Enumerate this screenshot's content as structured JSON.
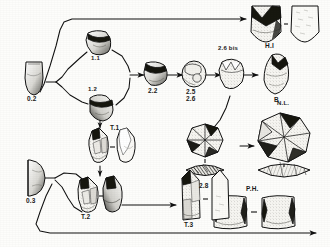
{
  "figure": {
    "background_color": "#fdfdfb",
    "ink_color": "#1a1a1a"
  },
  "stages": {
    "raw_nodule_upper": {
      "label": "0.2",
      "icon": "flint-nodule-icon",
      "description": "Unworked flint nodule, upper branch starting point"
    },
    "blank_upper": {
      "label": "1.1",
      "icon": "flake-blank-icon",
      "description": "Initial flake blank, upper variant"
    },
    "blank_lower": {
      "label": "1.2",
      "icon": "flake-blank-icon",
      "description": "Initial flake blank, lower variant"
    },
    "core_stage_2_2": {
      "label": "2.2",
      "icon": "prepared-core-icon",
      "description": "Prepared core, stage 2.2"
    },
    "core_stage_2_5_2_6": {
      "label_line1": "2.5",
      "label_line2": "2.6",
      "icon": "prepared-core-icon",
      "description": "Prepared core, stages 2.5 and 2.6"
    },
    "core_stage_2_6_bis": {
      "label": "2.6 bis",
      "icon": "prepared-core-icon",
      "description": "Prepared core variant, stage 2.6 bis"
    },
    "product_b": {
      "label": "B",
      "icon": "biface-point-icon",
      "description": "Biface / pointed product B"
    },
    "product_h1": {
      "label": "H.I",
      "icon": "scraper-pair-icon",
      "description": "Product H.I shown as worked piece plus outline"
    },
    "product_nl": {
      "label": "N.L.",
      "icon": "discoidal-core-icon",
      "description": "Product N.L., discoidal core with section view"
    },
    "core_stage_2_8": {
      "label": "2.8",
      "icon": "discoidal-core-icon",
      "description": "Discoidal core stage 2.8 with section view"
    },
    "product_ph": {
      "label": "P.H.",
      "icon": "blade-pair-icon",
      "description": "Product P.H., pair of blade segments"
    },
    "raw_nodule_lower": {
      "label": "0.3",
      "icon": "flint-nodule-half-icon",
      "description": "Unworked flint nodule, lower branch starting point"
    },
    "point_t1": {
      "label": "T.1",
      "icon": "point-pair-icon",
      "description": "Pointed tool T.1 with outline counterpart"
    },
    "point_t2": {
      "label": "T.2",
      "icon": "point-pair-icon",
      "description": "Pointed tool T.2 with outline counterpart"
    },
    "point_t3": {
      "label": "T.3",
      "icon": "point-pair-icon",
      "description": "Pointed tool T.3 with outline counterpart"
    }
  },
  "connectors": [
    {
      "name": "nodule-02-to-blank-11",
      "type": "branch-arrow"
    },
    {
      "name": "nodule-02-to-blank-12",
      "type": "branch-arrow"
    },
    {
      "name": "nodule-02-to-h1-bypass",
      "type": "long-arrow"
    },
    {
      "name": "blank-11-to-core-22",
      "type": "merge-arrow"
    },
    {
      "name": "blank-12-to-core-22",
      "type": "merge-arrow"
    },
    {
      "name": "blank-12-down-to-t1",
      "type": "down-arrow"
    },
    {
      "name": "core-22-to-core-25",
      "type": "straight-arrow"
    },
    {
      "name": "core-25-to-core-26bis",
      "type": "straight-arrow"
    },
    {
      "name": "core-26bis-to-product-b",
      "type": "straight-arrow"
    },
    {
      "name": "core-26bis-to-core-28",
      "type": "curved-arrow"
    },
    {
      "name": "core-28-to-nl",
      "type": "straight-arrow"
    },
    {
      "name": "t1-to-t2",
      "type": "down-arrow"
    },
    {
      "name": "t2-to-t3",
      "type": "straight-arrow"
    },
    {
      "name": "nodule-03-to-t1",
      "type": "curved-arrow"
    },
    {
      "name": "nodule-03-to-t2",
      "type": "curved-arrow"
    },
    {
      "name": "nodule-03-to-ph-bypass",
      "type": "long-arrow"
    }
  ]
}
